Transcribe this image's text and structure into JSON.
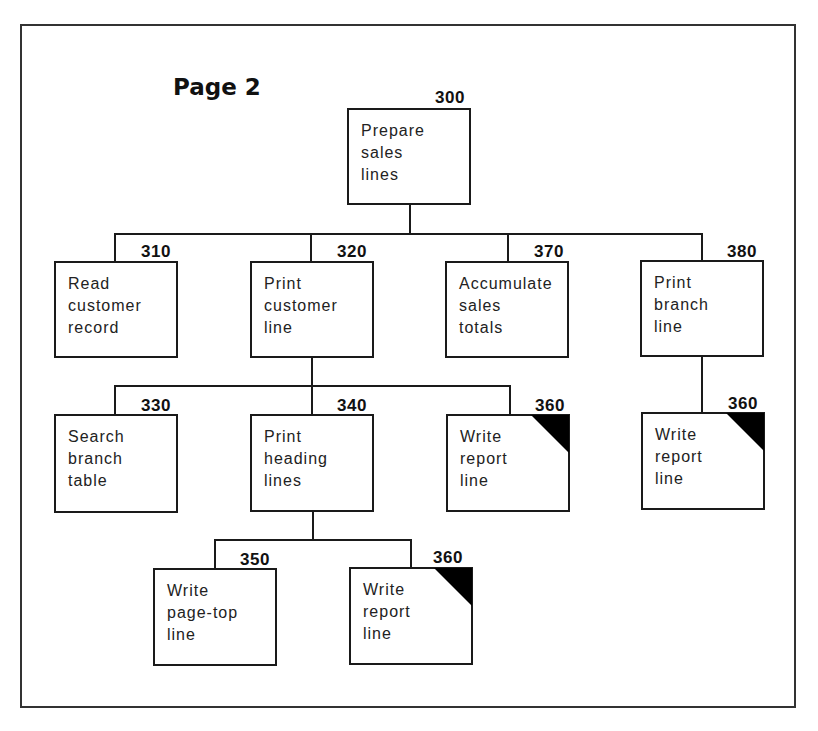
{
  "diagram": {
    "title": "Page 2",
    "type": "structure-chart",
    "nodes": [
      {
        "id": "n300",
        "number": "300",
        "label": "Prepare\nsales\nlines",
        "common_module": false
      },
      {
        "id": "n310",
        "number": "310",
        "label": "Read\ncustomer\nrecord",
        "common_module": false
      },
      {
        "id": "n320",
        "number": "320",
        "label": "Print\ncustomer\nline",
        "common_module": false
      },
      {
        "id": "n370",
        "number": "370",
        "label": "Accumulate\nsales\ntotals",
        "common_module": false
      },
      {
        "id": "n380",
        "number": "380",
        "label": "Print\nbranch\nline",
        "common_module": false
      },
      {
        "id": "n330",
        "number": "330",
        "label": "Search\nbranch\ntable",
        "common_module": false
      },
      {
        "id": "n340",
        "number": "340",
        "label": "Print\nheading\nlines",
        "common_module": false
      },
      {
        "id": "n360a",
        "number": "360",
        "label": "Write\nreport\nline",
        "common_module": true
      },
      {
        "id": "n360b",
        "number": "360",
        "label": "Write\nreport\nline",
        "common_module": true
      },
      {
        "id": "n350",
        "number": "350",
        "label": "Write\npage-top\nline",
        "common_module": false
      },
      {
        "id": "n360c",
        "number": "360",
        "label": "Write\nreport\nline",
        "common_module": true
      }
    ],
    "edges": [
      [
        "300",
        "310"
      ],
      [
        "300",
        "320"
      ],
      [
        "300",
        "370"
      ],
      [
        "300",
        "380"
      ],
      [
        "320",
        "330"
      ],
      [
        "320",
        "340"
      ],
      [
        "320",
        "360"
      ],
      [
        "380",
        "360"
      ],
      [
        "340",
        "350"
      ],
      [
        "340",
        "360"
      ]
    ]
  }
}
